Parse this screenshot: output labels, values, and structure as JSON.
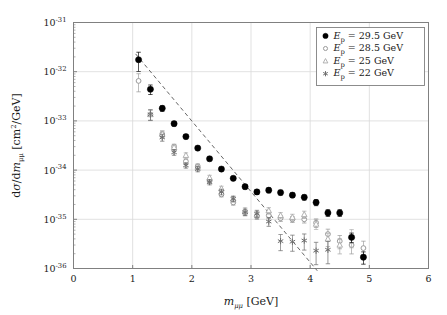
{
  "chart_data": {
    "type": "scatter",
    "title": "",
    "xlabel": "m_mumu [GeV]",
    "ylabel": "dsigma/dm_mumu [cm^2/GeV]",
    "xlim": [
      0,
      6
    ],
    "ylim": [
      1e-36,
      1e-31
    ],
    "yscale": "log",
    "grid": true,
    "legend_position": "top-right",
    "xticks": [
      "0",
      "1",
      "2",
      "3",
      "4",
      "5",
      "6"
    ],
    "xtick_values": [
      0,
      1,
      2,
      3,
      4,
      5,
      6
    ],
    "ytick_exponents": [
      -31,
      -32,
      -33,
      -34,
      -35,
      -36
    ],
    "series": [
      {
        "name": "E_p = 29.5 GeV",
        "marker": "filled-circle",
        "color": "#000000",
        "x": [
          1.1,
          1.3,
          1.5,
          1.7,
          1.9,
          2.1,
          2.3,
          2.5,
          2.7,
          2.9,
          3.1,
          3.3,
          3.5,
          3.7,
          3.9,
          4.1,
          4.3,
          4.5,
          4.7,
          4.9
        ],
        "y": [
          1.75e-32,
          4.4e-33,
          1.8e-33,
          8.8e-34,
          4.8e-34,
          2.8e-34,
          1.7e-34,
          1.05e-34,
          6.8e-35,
          4.6e-35,
          3.6e-35,
          3.9e-35,
          3.5e-35,
          3.1e-35,
          2.8e-35,
          2.2e-35,
          1.35e-35,
          1.35e-35,
          4.3e-36,
          1.7e-36
        ],
        "yerr_rel": [
          0.42,
          0.22,
          0.13,
          0.1,
          0.1,
          0.09,
          0.09,
          0.09,
          0.1,
          0.1,
          0.11,
          0.11,
          0.11,
          0.11,
          0.12,
          0.14,
          0.16,
          0.16,
          0.22,
          0.28
        ]
      },
      {
        "name": "E_p = 28.5 GeV",
        "marker": "open-circle",
        "color": "#9a9a9a",
        "x": [
          1.1,
          1.3,
          1.5,
          1.7,
          1.9,
          2.1,
          2.3,
          2.5,
          2.7,
          2.9,
          3.1,
          3.3,
          3.5,
          3.7,
          3.9,
          4.1,
          4.3,
          4.5,
          4.7,
          4.9
        ],
        "y": [
          6.5e-33,
          1.35e-33,
          5.4e-34,
          3e-34,
          1.5e-34,
          1.2e-34,
          6e-35,
          3.2e-35,
          2.2e-35,
          1.35e-35,
          1.15e-35,
          1.2e-35,
          1.05e-35,
          1e-35,
          1e-35,
          8.5e-36,
          5e-36,
          3.6e-36,
          3e-36,
          2.6e-36
        ],
        "yerr_rel": [
          0.4,
          0.24,
          0.15,
          0.12,
          0.12,
          0.11,
          0.11,
          0.11,
          0.12,
          0.13,
          0.14,
          0.14,
          0.14,
          0.14,
          0.16,
          0.2,
          0.26,
          0.3,
          0.34,
          0.38
        ]
      },
      {
        "name": "E_p = 25 GeV",
        "marker": "open-triangle",
        "color": "#a8a8a8",
        "x": [
          1.3,
          1.5,
          1.7,
          1.9,
          2.1,
          2.3,
          2.5,
          2.7,
          2.9,
          3.1,
          3.3,
          3.5,
          3.7,
          3.9,
          4.1,
          4.3,
          4.5,
          4.7
        ],
        "y": [
          1.35e-33,
          5.4e-34,
          2.9e-34,
          2e-34,
          1.15e-34,
          7e-35,
          4.2e-35,
          2.6e-35,
          1.5e-35,
          1.25e-35,
          1.5e-35,
          1.2e-35,
          1.1e-35,
          1.25e-35,
          8e-36,
          4e-36,
          3e-36,
          4.4e-36
        ],
        "yerr_rel": [
          0.25,
          0.16,
          0.13,
          0.12,
          0.12,
          0.12,
          0.12,
          0.13,
          0.14,
          0.15,
          0.15,
          0.15,
          0.15,
          0.17,
          0.22,
          0.3,
          0.34,
          0.4
        ]
      },
      {
        "name": "E_p = 22 GeV",
        "marker": "asterisk",
        "color": "#6e6e6e",
        "x": [
          1.3,
          1.5,
          1.7,
          1.9,
          2.1,
          2.3,
          2.5,
          2.7,
          2.9,
          3.1,
          3.3,
          3.5,
          3.7,
          3.9,
          4.1,
          4.3
        ],
        "y": [
          1.35e-33,
          4.6e-34,
          2.3e-34,
          1.25e-34,
          1.05e-34,
          5.7e-35,
          3.6e-35,
          2.6e-35,
          1.4e-35,
          1.3e-35,
          9e-36,
          3.6e-36,
          3.5e-36,
          3.7e-36,
          2.3e-36,
          2.4e-36
        ],
        "yerr_rel": [
          0.24,
          0.16,
          0.13,
          0.12,
          0.12,
          0.12,
          0.13,
          0.13,
          0.15,
          0.17,
          0.2,
          0.36,
          0.36,
          0.36,
          0.48,
          0.48
        ]
      }
    ],
    "fit_line": {
      "style": "dashed",
      "color": "#555555",
      "x": [
        1.05,
        4.12
      ],
      "y": [
        2.3e-32,
        9e-37
      ]
    }
  },
  "legend": {
    "entries": [
      {
        "marker": "filled-circle",
        "label_prefix": "E",
        "label_sub": "p",
        "label_rest": " = 29.5 GeV"
      },
      {
        "marker": "open-circle",
        "label_prefix": "E",
        "label_sub": "p",
        "label_rest": " = 28.5 GeV"
      },
      {
        "marker": "open-triangle",
        "label_prefix": "E",
        "label_sub": "p",
        "label_rest": " = 25 GeV"
      },
      {
        "marker": "asterisk",
        "label_prefix": "E",
        "label_sub": "p",
        "label_rest": " = 22 GeV"
      }
    ]
  },
  "axes": {
    "x_label_main": "m",
    "x_label_sub": "μμ",
    "x_label_unit": "[GeV]",
    "y_label_num": "dσ",
    "y_label_den": "dm",
    "y_label_den_sub": "μμ",
    "y_label_unit_open": "[cm",
    "y_label_unit_sup": "2",
    "y_label_unit_close": "/GeV]",
    "xticks": [
      "0",
      "1",
      "2",
      "3",
      "4",
      "5",
      "6"
    ],
    "yticks": [
      "-31",
      "-32",
      "-33",
      "-34",
      "-35",
      "-36"
    ],
    "ybase": "10"
  },
  "colors": {
    "frame": "#808080",
    "grid": "#d9d9d9",
    "series1": "#000000",
    "series2": "#9a9a9a",
    "series3": "#a8a8a8",
    "series4": "#6e6e6e",
    "fit": "#555555",
    "background": "#ffffff"
  }
}
